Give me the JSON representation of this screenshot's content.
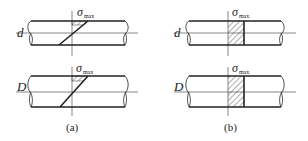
{
  "figure": {
    "panels": [
      {
        "id": "a",
        "caption": "(a)",
        "description": "Inclined (spiral) cut: stress distribution shown on a diagonal section",
        "rows": [
          {
            "diameter_label": "d",
            "stress_label": "σ",
            "stress_subscript": "max"
          },
          {
            "diameter_label": "D",
            "stress_label": "σ",
            "stress_subscript": "max"
          }
        ]
      },
      {
        "id": "b",
        "caption": "(b)",
        "description": "Transverse cut: uniform hatched stress band across the section",
        "rows": [
          {
            "diameter_label": "d",
            "stress_label": "σ",
            "stress_subscript": "max"
          },
          {
            "diameter_label": "D",
            "stress_label": "σ",
            "stress_subscript": "max"
          }
        ]
      }
    ],
    "colors": {
      "line": "#222222",
      "thin_line": "#555555",
      "background": "#ffffff"
    }
  }
}
